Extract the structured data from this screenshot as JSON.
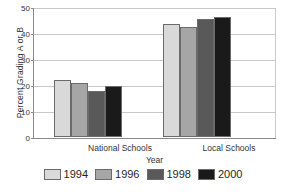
{
  "chart_data": {
    "type": "bar",
    "title": "",
    "xlabel": "Year",
    "ylabel": "Percent Grading A or B",
    "categories": [
      "National Schools",
      "Local Schools"
    ],
    "series": [
      {
        "name": "1994",
        "values": [
          21.8,
          43.4
        ],
        "color": "#d9d9d9"
      },
      {
        "name": "1996",
        "values": [
          20.6,
          42.3
        ],
        "color": "#a6a6a6"
      },
      {
        "name": "1998",
        "values": [
          17.7,
          45.3
        ],
        "color": "#595959"
      },
      {
        "name": "2000",
        "values": [
          19.6,
          46.2
        ],
        "color": "#1a1a1a"
      }
    ],
    "ylim": [
      0,
      50
    ],
    "yticks": [
      0,
      10,
      20,
      30,
      40,
      50
    ],
    "ytick_labels": [
      "0",
      "10",
      "20",
      "30",
      "40",
      "50"
    ],
    "grid": true,
    "legend_position": "bottom"
  },
  "colors": {
    "axis": "#8a8a8a",
    "grid": "#c9c9c9",
    "bar_outline": "#6b6b6b",
    "background": "#ffffff",
    "text": "#333333"
  }
}
